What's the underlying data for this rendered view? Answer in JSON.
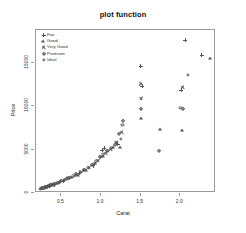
{
  "chart_data": {
    "type": "scatter",
    "title": "plot function",
    "xlabel": "Carat",
    "ylabel": "Price",
    "xlim": [
      0.18,
      2.45
    ],
    "ylim": [
      0,
      18800
    ],
    "grid": false,
    "legend_position": "top-left",
    "xticks": [
      0.5,
      1.0,
      1.5,
      2.0
    ],
    "xtick_labels": [
      "0.5",
      "1.0",
      "1.5",
      "2.0"
    ],
    "yticks": [
      0,
      5000,
      10000,
      15000
    ],
    "ytick_labels": [
      "0",
      "5000",
      "10000",
      "15000"
    ],
    "series": [
      {
        "name": "Fair",
        "symbol": "plus",
        "points": [
          [
            0.31,
            700
          ],
          [
            0.35,
            820
          ],
          [
            0.41,
            980
          ],
          [
            0.52,
            1400
          ],
          [
            0.72,
            2250
          ],
          [
            0.9,
            3150
          ],
          [
            1.01,
            4950
          ],
          [
            1.04,
            5150
          ],
          [
            1.21,
            5600
          ],
          [
            1.5,
            14600
          ],
          [
            1.52,
            12300
          ],
          [
            2.01,
            11900
          ],
          [
            2.06,
            17600
          ],
          [
            2.27,
            15900
          ]
        ]
      },
      {
        "name": "Good",
        "symbol": "triangle",
        "points": [
          [
            0.28,
            620
          ],
          [
            0.33,
            760
          ],
          [
            0.37,
            900
          ],
          [
            0.44,
            1100
          ],
          [
            0.55,
            1600
          ],
          [
            0.62,
            1850
          ],
          [
            0.71,
            2100
          ],
          [
            0.81,
            2700
          ],
          [
            0.92,
            3500
          ],
          [
            1.03,
            4300
          ],
          [
            1.15,
            5350
          ],
          [
            1.24,
            5300
          ],
          [
            1.51,
            8650
          ],
          [
            1.74,
            7350
          ],
          [
            2.02,
            7300
          ],
          [
            2.38,
            15600
          ]
        ]
      },
      {
        "name": "Very Good",
        "symbol": "cross",
        "points": [
          [
            0.26,
            560
          ],
          [
            0.3,
            680
          ],
          [
            0.34,
            800
          ],
          [
            0.39,
            950
          ],
          [
            0.47,
            1250
          ],
          [
            0.58,
            1700
          ],
          [
            0.66,
            2000
          ],
          [
            0.75,
            2450
          ],
          [
            0.85,
            2950
          ],
          [
            0.96,
            3800
          ],
          [
            1.06,
            4600
          ],
          [
            1.12,
            5050
          ],
          [
            1.19,
            5850
          ],
          [
            1.26,
            7000
          ],
          [
            1.5,
            12600
          ],
          [
            1.51,
            10900
          ],
          [
            2.03,
            12200
          ]
        ]
      },
      {
        "name": "Premium",
        "symbol": "diamond",
        "points": [
          [
            0.25,
            520
          ],
          [
            0.29,
            640
          ],
          [
            0.32,
            740
          ],
          [
            0.36,
            870
          ],
          [
            0.42,
            1050
          ],
          [
            0.5,
            1380
          ],
          [
            0.6,
            1780
          ],
          [
            0.69,
            2150
          ],
          [
            0.78,
            2600
          ],
          [
            0.88,
            3250
          ],
          [
            0.99,
            4100
          ],
          [
            1.08,
            4800
          ],
          [
            1.17,
            5500
          ],
          [
            1.23,
            6750
          ],
          [
            1.28,
            8300
          ],
          [
            1.5,
            9700
          ],
          [
            1.73,
            4800
          ],
          [
            2.04,
            9700
          ]
        ]
      },
      {
        "name": "Ideal",
        "symbol": "circle",
        "points": [
          [
            0.23,
            440
          ],
          [
            0.24,
            480
          ],
          [
            0.27,
            590
          ],
          [
            0.31,
            700
          ],
          [
            0.33,
            780
          ],
          [
            0.38,
            920
          ],
          [
            0.4,
            1000
          ],
          [
            0.45,
            1180
          ],
          [
            0.48,
            1300
          ],
          [
            0.53,
            1500
          ],
          [
            0.57,
            1680
          ],
          [
            0.63,
            1900
          ],
          [
            0.68,
            2080
          ],
          [
            0.73,
            2350
          ],
          [
            0.79,
            2680
          ],
          [
            0.83,
            2850
          ],
          [
            0.91,
            3400
          ],
          [
            0.94,
            3650
          ],
          [
            1.0,
            4200
          ],
          [
            1.02,
            4450
          ],
          [
            1.09,
            4900
          ],
          [
            1.13,
            5200
          ],
          [
            1.2,
            5750
          ],
          [
            1.25,
            6200
          ],
          [
            1.27,
            7900
          ],
          [
            2.0,
            9800
          ],
          [
            2.1,
            13600
          ]
        ]
      }
    ]
  },
  "legend": {
    "entries": [
      {
        "label": "Fair",
        "symbol": "plus"
      },
      {
        "label": "Good",
        "symbol": "triangle"
      },
      {
        "label": "Very Good",
        "symbol": "cross"
      },
      {
        "label": "Premium",
        "symbol": "diamond"
      },
      {
        "label": "Ideal",
        "symbol": "circle"
      }
    ]
  },
  "colors": {
    "point": "#555555",
    "frame": "#9a9a9a",
    "text": "#222222",
    "background": "#ffffff"
  }
}
